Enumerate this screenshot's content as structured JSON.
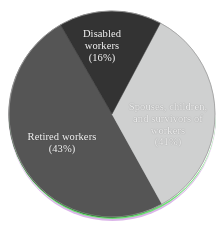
{
  "figure": {
    "background_color": "#ffffff",
    "artifact": "scan-chromatic-fringe-bottom-arc"
  },
  "chart_data": {
    "type": "pie",
    "title": "",
    "subtitle": "",
    "xlabel": "",
    "ylabel": "",
    "legend_position": "none",
    "labels_inside_slices": true,
    "total_percent": 100,
    "categories": [
      "Retired workers",
      "Spouses, children, and survivors of workers",
      "Disabled workers"
    ],
    "values": [
      43,
      41,
      16
    ],
    "slices": [
      {
        "name": "retired-workers",
        "label_lines": [
          "Retired workers",
          "(43%)"
        ],
        "label_text": "Retired workers (43%)",
        "value": 43,
        "percent_text": "(43%)",
        "color": "#555555",
        "start_angle_deg": 151,
        "end_angle_deg": 330
      },
      {
        "name": "spouses-children-survivors",
        "label_lines": [
          "Spouses, children,",
          "and survivors of",
          "workers",
          "(41%)"
        ],
        "label_text": "Spouses, children, and survivors of workers (41%)",
        "value": 41,
        "percent_text": "(41%)",
        "color": "#cfd0d0",
        "start_angle_deg": 28,
        "end_angle_deg": 151
      },
      {
        "name": "disabled-workers",
        "label_lines": [
          "Disabled",
          "workers",
          "(16%)"
        ],
        "label_text": "Disabled workers (16%)",
        "value": 16,
        "percent_text": "(16%)",
        "color": "#333333",
        "start_angle_deg": 330,
        "end_angle_deg": 28
      }
    ],
    "geometry": {
      "center_x": 112,
      "center_y": 114,
      "radius": 103
    },
    "label_color": "#f2f2f2"
  }
}
